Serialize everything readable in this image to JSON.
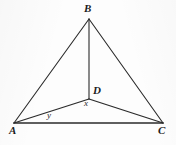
{
  "figure": {
    "kind": "geometry-diagram",
    "width": 176,
    "height": 145,
    "background_color": "#fdfdfd",
    "stroke_color": "#2b2b2b",
    "labels": {
      "B": "B",
      "A": "A",
      "C": "C",
      "D": "D",
      "x": "x",
      "y": "y"
    },
    "points": {
      "A": {
        "x": 14,
        "y": 123
      },
      "B": {
        "x": 89,
        "y": 19
      },
      "C": {
        "x": 163,
        "y": 123
      },
      "D": {
        "x": 89,
        "y": 99
      }
    },
    "label_positions": {
      "B": {
        "x": 84,
        "y": 3
      },
      "A": {
        "x": 9,
        "y": 125
      },
      "C": {
        "x": 158,
        "y": 125
      },
      "D": {
        "x": 93,
        "y": 85
      },
      "x": {
        "x": 84,
        "y": 99
      },
      "y": {
        "x": 47,
        "y": 111
      }
    },
    "segments": [
      {
        "name": "AB",
        "from": "A",
        "to": "B",
        "width": 1.1
      },
      {
        "name": "BC",
        "from": "B",
        "to": "C",
        "width": 1.1
      },
      {
        "name": "AC",
        "from": "A",
        "to": "C",
        "width": 1.6
      },
      {
        "name": "BD",
        "from": "B",
        "to": "D",
        "width": 1.1
      },
      {
        "name": "AD",
        "from": "A",
        "to": "D",
        "width": 1.3
      },
      {
        "name": "DC",
        "from": "D",
        "to": "C",
        "width": 1.3
      }
    ]
  }
}
